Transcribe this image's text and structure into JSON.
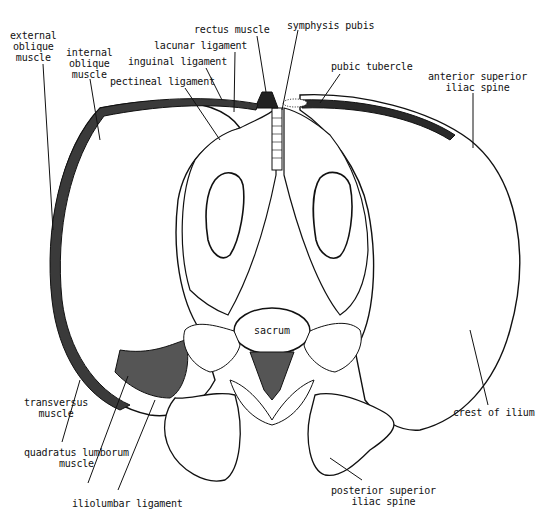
{
  "figure": {
    "title": "",
    "colors": {
      "ink": "#111111",
      "muscle_fill": "#4a4a4a",
      "bone_fill": "#ffffff",
      "background": "#ffffff"
    },
    "structures": {
      "sacrum": "sacrum"
    },
    "labels": {
      "external_oblique": [
        "external",
        "oblique",
        "muscle"
      ],
      "internal_oblique": [
        "internal",
        "oblique",
        "muscle"
      ],
      "pectineal_ligament": "pectineal ligament",
      "inguinal_ligament": "inguinal ligament",
      "lacunar_ligament": "lacunar ligament",
      "rectus_muscle": "rectus muscle",
      "symphysis_pubis": "symphysis pubis",
      "pubic_tubercle": "pubic tubercle",
      "anterior_superior_iliac_spine": [
        "anterior superior",
        "iliac spine"
      ],
      "transversus_muscle": [
        "transversus",
        "muscle"
      ],
      "quadratus_lumborum_muscle": [
        "quadratus lumborum",
        "muscle"
      ],
      "iliolumbar_ligament": "iliolumbar ligament",
      "crest_of_ilium": "crest of ilium",
      "posterior_superior_iliac_spine": [
        "posterior superior",
        "iliac spine"
      ]
    }
  }
}
